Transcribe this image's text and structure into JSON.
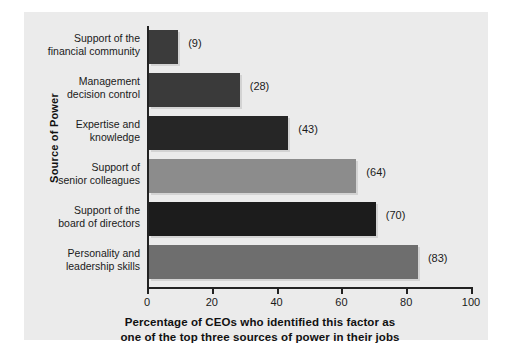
{
  "chart_data": {
    "type": "bar",
    "orientation": "horizontal",
    "title": "",
    "xlabel_line1": "Percentage of CEOs who identified this factor as",
    "xlabel_line2": "one of the top three sources of power in their jobs",
    "ylabel": "Source of Power",
    "xlim": [
      0,
      100
    ],
    "xticks": [
      0,
      20,
      40,
      60,
      80,
      100
    ],
    "xticklabels": [
      "0",
      "20",
      "40",
      "60",
      "80",
      "100"
    ],
    "grid": false,
    "legend": false,
    "categories": [
      "Support of the\nfinancial community",
      "Management\ndecision control",
      "Expertise and\nknowledge",
      "Support of\nsenior colleagues",
      "Support of the\nboard of directors",
      "Personality and\nleadership skills"
    ],
    "values": [
      9,
      28,
      43,
      64,
      70,
      83
    ],
    "value_labels": [
      "(9)",
      "(28)",
      "(43)",
      "(64)",
      "(70)",
      "(83)"
    ],
    "bar_colors": [
      "#3b3b3b",
      "#3a3a3a",
      "#262626",
      "#8c8c8c",
      "#1c1c1c",
      "#6e6e6e"
    ],
    "bars": [
      {
        "category_line1": "Support of the",
        "category_line2": "financial community",
        "value": 9,
        "label": "(9)",
        "color": "#3b3b3b"
      },
      {
        "category_line1": "Management",
        "category_line2": "decision control",
        "value": 28,
        "label": "(28)",
        "color": "#3a3a3a"
      },
      {
        "category_line1": "Expertise and",
        "category_line2": "knowledge",
        "value": 43,
        "label": "(43)",
        "color": "#262626"
      },
      {
        "category_line1": "Support of",
        "category_line2": "senior colleagues",
        "value": 64,
        "label": "(64)",
        "color": "#8c8c8c"
      },
      {
        "category_line1": "Support of the",
        "category_line2": "board of directors",
        "value": 70,
        "label": "(70)",
        "color": "#1c1c1c"
      },
      {
        "category_line1": "Personality and",
        "category_line2": "leadership skills",
        "value": 83,
        "label": "(83)",
        "color": "#6e6e6e"
      }
    ]
  },
  "colors": {
    "panel_background": "#ebebeb",
    "figure_background": "#ffffff",
    "axis": "#222222",
    "text": "#1a1a1a"
  }
}
